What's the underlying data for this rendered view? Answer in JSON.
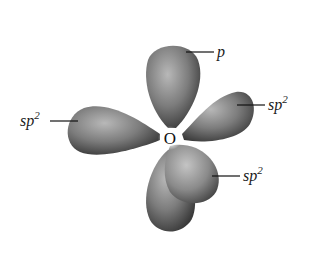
{
  "diagram": {
    "central_atom": "O",
    "orbitals": [
      {
        "id": "p-top",
        "type": "p",
        "label_base": "p",
        "label_sup": "",
        "lobe": "upper"
      },
      {
        "id": "sp2-left",
        "type": "sp2",
        "label_base": "sp",
        "label_sup": "2",
        "lobe": "left"
      },
      {
        "id": "sp2-right",
        "type": "sp2",
        "label_base": "sp",
        "label_sup": "2",
        "lobe": "right"
      },
      {
        "id": "sp2-lower",
        "type": "sp2",
        "label_base": "sp",
        "label_sup": "2",
        "lobe": "lower-front"
      }
    ],
    "colors": {
      "lobe_light": "#b5b5b5",
      "lobe_mid": "#7a7a7a",
      "lobe_dark": "#3c3c3c",
      "background": "#ffffff",
      "text": "#1a1a1a"
    }
  }
}
